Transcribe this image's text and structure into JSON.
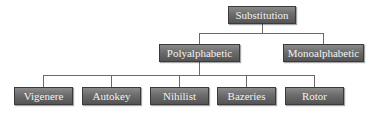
{
  "diagram": {
    "type": "tree",
    "root": {
      "label": "Substitution",
      "children": [
        {
          "label": "Polyalphabetic",
          "children": [
            {
              "label": "Vigenere"
            },
            {
              "label": "Autokey"
            },
            {
              "label": "Nihilist"
            },
            {
              "label": "Bazeries"
            },
            {
              "label": "Rotor"
            }
          ]
        },
        {
          "label": "Monoalphabetic"
        }
      ]
    },
    "colors": {
      "node_fill": "#6c6c6c",
      "node_text": "#f2f2f2",
      "connector": "#6a6a6a",
      "background": "#ffffff"
    }
  }
}
